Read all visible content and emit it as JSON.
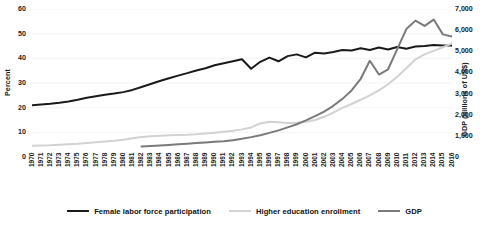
{
  "chart_data": {
    "type": "line",
    "title": "",
    "xlabel": "",
    "ylabel": "Percent",
    "y2label": "GDP (billions of US$)",
    "grid": true,
    "legend_position": "bottom",
    "ylim": [
      0,
      60
    ],
    "y2lim": [
      0,
      7000
    ],
    "yticks": [
      "0",
      "10",
      "20",
      "30",
      "40",
      "50",
      "60"
    ],
    "y2ticks": [
      "0",
      "1,000",
      "2,000",
      "3,000",
      "4,000",
      "5,000",
      "6,000",
      "7,000"
    ],
    "x": [
      "1970",
      "1971",
      "1972",
      "1973",
      "1974",
      "1975",
      "1976",
      "1977",
      "1978",
      "1979",
      "1980",
      "1981",
      "1982",
      "1983",
      "1984",
      "1985",
      "1986",
      "1987",
      "1988",
      "1989",
      "1990",
      "1991",
      "1992",
      "1993",
      "1994",
      "1995",
      "1996",
      "1997",
      "1998",
      "1999",
      "2000",
      "2001",
      "2002",
      "2003",
      "2004",
      "2005",
      "2006",
      "2007",
      "2008",
      "2009",
      "2010",
      "2011",
      "2012",
      "2013",
      "2014",
      "2015",
      "2016"
    ],
    "series": [
      {
        "name": "Female labor force participation",
        "axis": "left",
        "color": "#1a1a1a",
        "width": 2.0,
        "values": [
          21.0,
          21.3,
          21.6,
          22.0,
          22.5,
          23.2,
          24.0,
          24.6,
          25.2,
          25.7,
          26.3,
          27.2,
          28.4,
          29.6,
          30.8,
          31.9,
          33.0,
          34.0,
          35.1,
          36.0,
          37.2,
          38.0,
          38.8,
          39.6,
          35.8,
          38.6,
          40.3,
          38.8,
          40.9,
          41.6,
          40.4,
          42.3,
          42.0,
          42.6,
          43.4,
          43.2,
          44.1,
          43.4,
          44.4,
          43.6,
          44.6,
          43.9,
          44.8,
          45.0,
          45.4,
          45.2,
          45.2
        ]
      },
      {
        "name": "Higher education enrollment",
        "axis": "left",
        "color": "#d2d2d2",
        "width": 2.0,
        "values": [
          4.6,
          4.7,
          4.8,
          5.0,
          5.2,
          5.4,
          5.7,
          6.0,
          6.3,
          6.6,
          7.0,
          7.6,
          8.1,
          8.4,
          8.6,
          8.8,
          8.9,
          9.0,
          9.2,
          9.5,
          9.8,
          10.2,
          10.6,
          11.2,
          12.0,
          13.6,
          14.3,
          14.1,
          13.8,
          13.9,
          14.3,
          15.0,
          16.3,
          18.0,
          19.9,
          21.5,
          23.2,
          25.0,
          27.0,
          29.5,
          32.5,
          36.0,
          39.6,
          41.6,
          43.0,
          44.5,
          46.0
        ]
      },
      {
        "name": "GDP",
        "axis": "right",
        "color": "#7a7a7a",
        "width": 2.0,
        "start_year": "1982",
        "values": [
          null,
          null,
          null,
          null,
          null,
          null,
          null,
          null,
          null,
          null,
          null,
          null,
          500,
          520,
          545,
          570,
          600,
          630,
          660,
          690,
          720,
          740,
          790,
          860,
          940,
          1030,
          1140,
          1260,
          1400,
          1550,
          1730,
          1930,
          2150,
          2420,
          2750,
          3150,
          3700,
          4550,
          3900,
          4150,
          5100,
          6050,
          6450,
          6200,
          6500,
          5800,
          5700
        ]
      }
    ]
  }
}
